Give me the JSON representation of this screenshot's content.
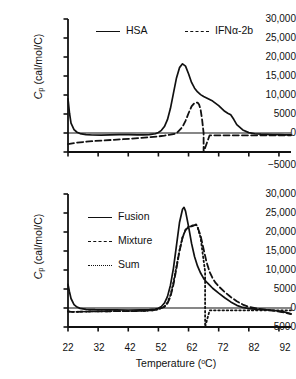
{
  "figure": {
    "type": "dsc-thermogram-two-panel",
    "xaxis_title_main": "Temperature (",
    "xaxis_title_unit": "o",
    "xaxis_title_tail": "C)",
    "xaxis_title_full": "Temperature (°C)",
    "yaxis_title_symbol": "C",
    "yaxis_title_sub": "p",
    "yaxis_title_units": " (cal/mol/C)"
  },
  "panels": [
    {
      "id": "top",
      "legend": [
        {
          "label": "HSA",
          "style": "solid"
        },
        {
          "label": "IFNα-2b",
          "style": "dashed"
        }
      ]
    },
    {
      "id": "bottom",
      "legend": [
        {
          "label": "Fusion",
          "style": "solid"
        },
        {
          "label": "Mixture",
          "style": "dashed"
        },
        {
          "label": "Sum",
          "style": "dotted"
        }
      ]
    }
  ],
  "ticks": {
    "y": [
      "30,000",
      "25,000",
      "20,000",
      "15,000",
      "10,000",
      "5000",
      "0",
      "−5000"
    ],
    "y_values": [
      30000,
      25000,
      20000,
      15000,
      10000,
      5000,
      0,
      -5000
    ],
    "x": [
      "22",
      "32",
      "42",
      "52",
      "62",
      "72",
      "82",
      "92"
    ],
    "x_values": [
      22,
      32,
      42,
      52,
      62,
      72,
      82,
      92
    ]
  },
  "chart_data": [
    {
      "type": "line",
      "title": "",
      "panel": "top",
      "xlabel": "Temperature (°C)",
      "ylabel": "Cp (cal/mol/C)",
      "xlim": [
        22,
        96
      ],
      "ylim": [
        -5000,
        30000
      ],
      "grid": false,
      "legend_position": "top-center",
      "series": [
        {
          "name": "HSA",
          "style": "solid",
          "x": [
            22,
            22.5,
            23,
            24,
            25,
            26,
            28,
            30,
            33,
            36,
            39,
            42,
            45,
            47,
            49,
            51,
            52,
            53,
            54,
            55,
            56,
            57,
            58,
            59,
            60,
            61,
            62,
            63,
            64,
            65,
            66,
            67,
            68,
            70,
            72,
            74,
            75,
            76,
            77,
            78,
            80,
            82,
            84,
            86,
            88,
            90,
            92,
            94,
            96
          ],
          "y": [
            9000,
            5200,
            2600,
            900,
            200,
            -150,
            -420,
            -520,
            -540,
            -500,
            -450,
            -430,
            -480,
            -500,
            -420,
            -200,
            150,
            700,
            1700,
            3500,
            6500,
            10500,
            14500,
            17200,
            18200,
            17600,
            15600,
            13300,
            11800,
            10800,
            10100,
            9600,
            9200,
            8400,
            7200,
            5700,
            5200,
            4800,
            3600,
            2200,
            800,
            100,
            -200,
            -320,
            -380,
            -420,
            -450,
            -470,
            -490
          ]
        },
        {
          "name": "IFNα-2b",
          "style": "dashed",
          "x": [
            22,
            24,
            26,
            28,
            31,
            34,
            37,
            40,
            43,
            46,
            49,
            52,
            54,
            56,
            58,
            60,
            61,
            62,
            63,
            64,
            65,
            65.5,
            66,
            66.5,
            67,
            67,
            69,
            72,
            76,
            80,
            85,
            90,
            96
          ],
          "y": [
            -2900,
            -2650,
            -2450,
            -2300,
            -2100,
            -1950,
            -1800,
            -1650,
            -1500,
            -1300,
            -1100,
            -900,
            -700,
            -450,
            -100,
            1600,
            3200,
            5200,
            7000,
            7900,
            8000,
            7500,
            6200,
            3500,
            0,
            -5000,
            -600,
            -600,
            -600,
            -600,
            -600,
            -600,
            -600
          ]
        }
      ]
    },
    {
      "type": "line",
      "title": "",
      "panel": "bottom",
      "xlabel": "Temperature (°C)",
      "ylabel": "Cp (cal/mol/C)",
      "xlim": [
        22,
        96
      ],
      "ylim": [
        -5000,
        30000
      ],
      "grid": false,
      "legend_position": "left-upper",
      "series": [
        {
          "name": "Fusion",
          "style": "solid",
          "x": [
            22,
            22.5,
            23,
            24,
            25,
            26,
            28,
            31,
            34,
            38,
            42,
            46,
            49,
            51,
            52,
            53,
            54,
            55,
            56,
            57,
            58,
            59,
            60,
            60.5,
            61,
            62,
            63,
            64,
            65,
            66,
            67,
            68,
            69,
            70,
            72,
            74,
            76,
            78,
            80,
            82,
            84,
            86,
            88,
            90,
            92,
            94,
            96
          ],
          "y": [
            6200,
            4200,
            2500,
            900,
            250,
            -100,
            -350,
            -450,
            -480,
            -500,
            -520,
            -500,
            -450,
            -300,
            -50,
            400,
            1300,
            3000,
            6000,
            10500,
            16500,
            22500,
            26000,
            26500,
            25500,
            21500,
            17000,
            13500,
            11000,
            9200,
            7800,
            6800,
            6000,
            5200,
            3900,
            2700,
            1600,
            700,
            150,
            -150,
            -300,
            -400,
            -500,
            -600,
            -800,
            -1100,
            -1500
          ]
        },
        {
          "name": "Mixture",
          "style": "dashed",
          "x": [
            22,
            23,
            25,
            27,
            30,
            33,
            36,
            40,
            44,
            47,
            50,
            52,
            54,
            55,
            56,
            57,
            58,
            59,
            60,
            61,
            62,
            63,
            64,
            64.5,
            65,
            66,
            67,
            68,
            69,
            70,
            71,
            72,
            74,
            76,
            78,
            80,
            82,
            85,
            88,
            91,
            94,
            96
          ],
          "y": [
            -900,
            -1000,
            -1000,
            -950,
            -900,
            -880,
            -850,
            -820,
            -800,
            -750,
            -600,
            -350,
            300,
            1200,
            3000,
            6200,
            10500,
            15000,
            18500,
            20500,
            21300,
            21500,
            21800,
            21900,
            21300,
            19000,
            15500,
            12000,
            9500,
            7800,
            6600,
            5700,
            4200,
            2900,
            1800,
            900,
            300,
            -200,
            -500,
            -800,
            -1200,
            -1600
          ]
        },
        {
          "name": "Sum",
          "style": "dotted",
          "x": [
            22,
            23,
            25,
            27,
            30,
            33,
            36,
            40,
            44,
            47,
            50,
            52,
            54,
            55,
            56,
            57,
            58,
            59,
            60,
            61,
            62,
            63,
            64,
            64.5,
            65,
            66,
            67,
            67.5,
            67.5,
            69,
            72,
            76,
            80,
            85,
            90,
            96
          ],
          "y": [
            -900,
            -1000,
            -1000,
            -950,
            -900,
            -880,
            -850,
            -820,
            -800,
            -750,
            -600,
            -350,
            400,
            1400,
            3400,
            6800,
            11000,
            15200,
            18600,
            20600,
            21400,
            21600,
            21900,
            22000,
            21300,
            18500,
            12500,
            9600,
            -5000,
            -600,
            -600,
            -600,
            -600,
            -600,
            -600,
            -600
          ]
        }
      ]
    }
  ]
}
